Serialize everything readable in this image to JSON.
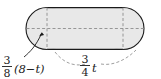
{
  "figure": {
    "name": "capsule-cylinder-diagram",
    "fill_color": "#e8e8e8",
    "stroke_color": "#1a1a1a",
    "dash_color": "#8c8c8c",
    "background": "#ffffff"
  },
  "labels": {
    "radius_label": {
      "name": "radius-label",
      "numerator": "3",
      "denominator": "8",
      "expression": "(8−t)",
      "full_text": "3/8(8−t)"
    },
    "length_label": {
      "name": "length-label",
      "numerator": "3",
      "denominator": "4",
      "expression": "t",
      "full_text": "3/4 t"
    }
  },
  "annotations": {
    "radius_leader": "arrow pointing to left circle radius",
    "length_brace": "dashed brace spanning rectangle width"
  }
}
